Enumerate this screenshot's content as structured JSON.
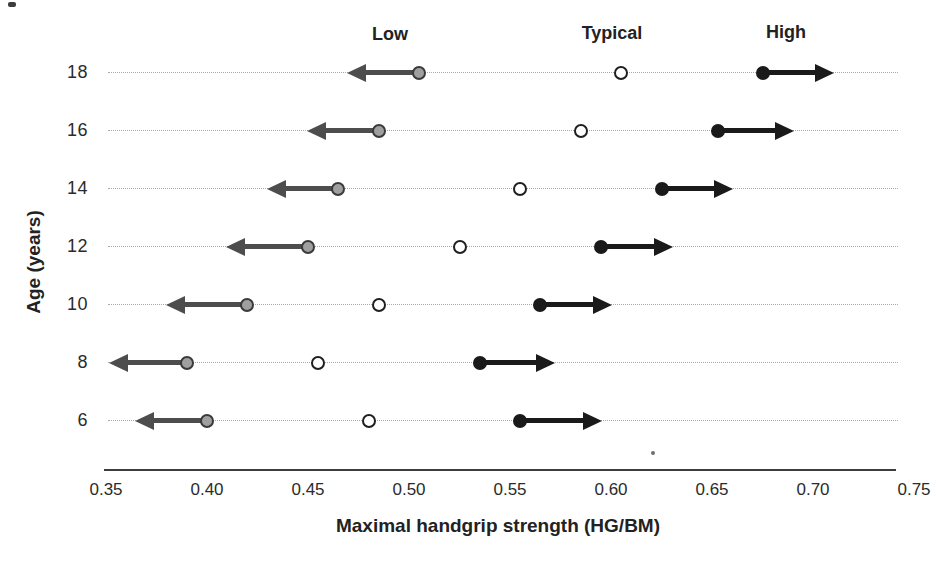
{
  "figure": {
    "ylabel": "Age (years)",
    "xlabel": "Maximal handgrip strength (HG/BM)"
  },
  "chart_data": {
    "type": "scatter",
    "title": "",
    "xlabel": "Maximal handgrip strength (HG/BM)",
    "ylabel": "Age (years)",
    "xlim": [
      0.35,
      0.75
    ],
    "x_tick_labels": [
      "0.35",
      "0.40",
      "0.45",
      "0.50",
      "0.55",
      "0.60",
      "0.65",
      "0.70",
      "0.75"
    ],
    "ages": [
      18,
      16,
      14,
      12,
      10,
      8,
      6
    ],
    "grid": "dotted horizontal line per age row",
    "legend_position": "top column headers above age-18 row",
    "series": [
      {
        "name": "Low",
        "marker": "gray-filled-circle",
        "arrow": "left",
        "values": [
          0.505,
          0.485,
          0.465,
          0.45,
          0.42,
          0.39,
          0.4
        ],
        "arrow_tips": [
          0.47,
          0.45,
          0.43,
          0.41,
          0.38,
          0.352,
          0.365
        ],
        "label_anchor_x": 0.49
      },
      {
        "name": "Typical",
        "marker": "open-circle",
        "arrow": "none",
        "values": [
          0.605,
          0.585,
          0.555,
          0.525,
          0.485,
          0.455,
          0.48
        ],
        "label_anchor_x": 0.6
      },
      {
        "name": "High",
        "marker": "black-filled-circle",
        "arrow": "right",
        "values": [
          0.675,
          0.653,
          0.625,
          0.595,
          0.565,
          0.535,
          0.555
        ],
        "arrow_tips": [
          0.71,
          0.69,
          0.66,
          0.63,
          0.6,
          0.572,
          0.595
        ],
        "label_anchor_x": 0.686
      }
    ]
  },
  "colors": {
    "low_fill": "#9f9f9f",
    "low_stroke": "#3a3a3a",
    "low_arrow": "#4d4d4d",
    "typical_fill": "#ffffff",
    "typical_stroke": "#1f1f1f",
    "high_fill": "#1a1a1a",
    "high_arrow": "#1a1a1a",
    "row_line": "#a9a9a9",
    "axis_line": "#3d3d3d",
    "text": "#262626",
    "background": "#ffffff"
  }
}
